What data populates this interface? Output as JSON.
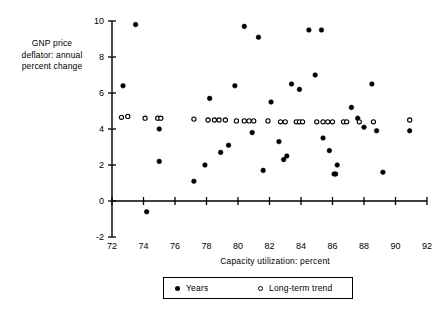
{
  "chart_data": {
    "type": "scatter",
    "title": "",
    "xlabel": "Capacity utilization: percent",
    "ylabel": "GNP price deflator: annual percent change",
    "ylabel_lines": [
      "GNP price",
      "deflator: annual",
      "percent change"
    ],
    "xlim": [
      72,
      92
    ],
    "ylim": [
      -2,
      10
    ],
    "xticks": [
      72,
      74,
      76,
      78,
      80,
      82,
      84,
      86,
      88,
      90,
      92
    ],
    "yticks": [
      10,
      8,
      6,
      4,
      2,
      0,
      -2
    ],
    "xtick_labels": [
      "72",
      "74",
      "76",
      "78",
      "80",
      "82",
      "84",
      "86",
      "88",
      "90",
      "92"
    ],
    "ytick_labels": [
      "10",
      "8",
      "6",
      "4",
      "2",
      "0",
      "-2"
    ],
    "grid": false,
    "legend_position": "bottom-center",
    "series": [
      {
        "name": "Years",
        "marker": "filled-circle",
        "color": "#000000",
        "points": [
          [
            73.5,
            9.8
          ],
          [
            72.7,
            6.4
          ],
          [
            75.0,
            4.0
          ],
          [
            74.2,
            -0.6
          ],
          [
            75.0,
            2.2
          ],
          [
            77.2,
            1.1
          ],
          [
            78.2,
            5.7
          ],
          [
            78.9,
            2.7
          ],
          [
            79.4,
            3.1
          ],
          [
            77.9,
            2.0
          ],
          [
            80.4,
            9.7
          ],
          [
            81.3,
            9.1
          ],
          [
            79.8,
            6.4
          ],
          [
            80.9,
            3.8
          ],
          [
            81.6,
            1.7
          ],
          [
            82.1,
            5.5
          ],
          [
            82.6,
            3.3
          ],
          [
            82.9,
            2.3
          ],
          [
            83.1,
            2.5
          ],
          [
            83.4,
            6.5
          ],
          [
            83.9,
            6.2
          ],
          [
            84.5,
            9.5
          ],
          [
            85.3,
            9.5
          ],
          [
            84.9,
            7.0
          ],
          [
            85.4,
            3.5
          ],
          [
            85.8,
            2.8
          ],
          [
            86.3,
            2.0
          ],
          [
            86.1,
            1.5
          ],
          [
            86.2,
            1.5
          ],
          [
            87.2,
            5.2
          ],
          [
            87.6,
            4.6
          ],
          [
            88.0,
            4.1
          ],
          [
            88.5,
            6.5
          ],
          [
            88.8,
            3.9
          ],
          [
            89.2,
            1.6
          ],
          [
            90.9,
            3.9
          ]
        ]
      },
      {
        "name": "Long-term trend",
        "marker": "open-circle",
        "color": "#000000",
        "points": [
          [
            72.6,
            4.65
          ],
          [
            73.0,
            4.7
          ],
          [
            74.1,
            4.6
          ],
          [
            74.9,
            4.6
          ],
          [
            75.1,
            4.6
          ],
          [
            77.2,
            4.55
          ],
          [
            78.1,
            4.5
          ],
          [
            78.5,
            4.5
          ],
          [
            78.8,
            4.5
          ],
          [
            79.2,
            4.5
          ],
          [
            79.9,
            4.45
          ],
          [
            80.4,
            4.45
          ],
          [
            80.7,
            4.45
          ],
          [
            81.0,
            4.45
          ],
          [
            81.9,
            4.45
          ],
          [
            82.7,
            4.4
          ],
          [
            83.0,
            4.4
          ],
          [
            83.7,
            4.4
          ],
          [
            83.9,
            4.4
          ],
          [
            84.1,
            4.4
          ],
          [
            85.0,
            4.4
          ],
          [
            85.4,
            4.4
          ],
          [
            85.7,
            4.4
          ],
          [
            86.0,
            4.4
          ],
          [
            86.7,
            4.4
          ],
          [
            86.9,
            4.4
          ],
          [
            87.7,
            4.4
          ],
          [
            88.6,
            4.4
          ],
          [
            90.9,
            4.5
          ]
        ]
      }
    ]
  },
  "legend": {
    "years_label": "Years",
    "trend_label": "Long-term trend"
  }
}
